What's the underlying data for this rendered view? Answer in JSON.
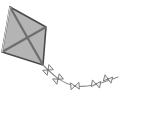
{
  "scene": {
    "title": "Kite with bow-tie tail",
    "width": 161,
    "height": 114,
    "background_color": "#ffffff",
    "style": "grayscale line drawing"
  },
  "kite": {
    "name": "kite",
    "fill_color": "#b4b4b4",
    "outline_color": "#4a4a4a",
    "spar_color": "#6e6e6e",
    "outline_width": 1.6,
    "spar_width": 2.2,
    "shape": "rhombus",
    "vertices": {
      "top": [
        10,
        7
      ],
      "right": [
        46,
        27
      ],
      "bottom": [
        43,
        65
      ],
      "left": [
        2,
        52
      ]
    },
    "polygon_points": "10,7 46,27 43,65 2,52",
    "spars": [
      {
        "name": "spar-diagonal-vertical",
        "x1": 10,
        "y1": 7,
        "x2": 43,
        "y2": 65
      },
      {
        "name": "spar-diagonal-horizontal",
        "x1": 2,
        "y1": 52,
        "x2": 46,
        "y2": 27
      }
    ],
    "highlight_edge": {
      "name": "kite-left-highlight",
      "points": "10,7 2,52",
      "color": "#d8d8d8",
      "width": 1.2
    }
  },
  "tail": {
    "name": "kite-tail",
    "string_color": "#8c8c8c",
    "string_width": 1.1,
    "path": "M 43 65 C 52 74, 62 84, 76 86 C 90 88, 104 82, 118 77",
    "end_point": [
      118,
      77
    ],
    "bows": [
      {
        "name": "tail-bow-1",
        "cx": 48,
        "cy": 70,
        "rotation": -42,
        "scale": 1.0
      },
      {
        "name": "tail-bow-2",
        "cx": 58,
        "cy": 79,
        "rotation": -38,
        "scale": 1.0
      },
      {
        "name": "tail-bow-3",
        "cx": 75,
        "cy": 86,
        "rotation": -4,
        "scale": 1.0
      },
      {
        "name": "tail-bow-4",
        "cx": 96,
        "cy": 84,
        "rotation": 10,
        "scale": 1.0
      },
      {
        "name": "tail-bow-5",
        "cx": 108,
        "cy": 79,
        "rotation": 16,
        "scale": 0.95
      }
    ],
    "bow": {
      "fill_color": "#f2f2f2",
      "stroke_color": "#7a7a7a",
      "stroke_width": 0.9,
      "half_width": 4.2,
      "half_height": 3.4,
      "knot_radius": 1.1
    }
  }
}
